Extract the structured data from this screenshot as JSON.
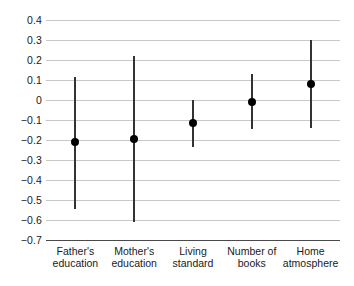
{
  "chart_data": {
    "type": "scatter",
    "title": "",
    "subtitle": "",
    "xlabel": "",
    "ylabel": "",
    "categories": [
      "Father's education",
      "Mother's education",
      "Living standard",
      "Number of books",
      "Home atmosphere"
    ],
    "category_label_lines": [
      [
        "Father's",
        "education"
      ],
      [
        "Mother's",
        "education"
      ],
      [
        "Living",
        "standard"
      ],
      [
        "Number of",
        "books"
      ],
      [
        "Home",
        "atmosphere"
      ]
    ],
    "values": [
      -0.21,
      -0.195,
      -0.115,
      -0.01,
      0.08
    ],
    "error_low": [
      -0.545,
      -0.61,
      -0.235,
      -0.145,
      -0.14
    ],
    "error_high": [
      0.115,
      0.22,
      0.0,
      0.13,
      0.3
    ],
    "ylim": [
      -0.7,
      0.4
    ],
    "ytick_values": [
      0.4,
      0.3,
      0.2,
      0.1,
      0,
      -0.1,
      -0.2,
      -0.3,
      -0.4,
      -0.5,
      -0.6,
      -0.7
    ],
    "ytick_labels": [
      "0.4",
      "0.3",
      "0.2",
      "0.1",
      "0",
      "−0.1",
      "−0.2",
      "−0.3",
      "−0.4",
      "−0.5",
      "−0.6",
      "−0.7"
    ],
    "grid": true,
    "legend": "none",
    "colors": {
      "point": "#000000",
      "errorbar": "#333333",
      "gridline": "#c8c8c8",
      "baseline": "#4a4a4a",
      "background": "#ffffff",
      "text": "#1a1a1a"
    }
  }
}
